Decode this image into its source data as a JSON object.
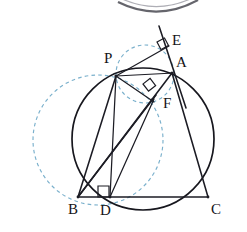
{
  "figure": {
    "canvas": {
      "width": 247,
      "height": 232,
      "background": "#ffffff"
    },
    "colors": {
      "stroke": "#1c1c24",
      "circle_stroke": "#17171e",
      "dashed_circle": "#7ab0cc",
      "label_text": "#141418",
      "top_arc": "#4a4a52"
    },
    "points": [
      {
        "id": "P",
        "label": "P",
        "x": 116,
        "y": 76,
        "label_x": 104,
        "label_y": 51
      },
      {
        "id": "A",
        "label": "A",
        "x": 172,
        "y": 73,
        "label_x": 176,
        "label_y": 55
      },
      {
        "id": "E",
        "label": "E",
        "x": 167,
        "y": 48,
        "label_x": 172,
        "label_y": 33
      },
      {
        "id": "F",
        "label": "F",
        "x": 152,
        "y": 100,
        "label_x": 163,
        "label_y": 96
      },
      {
        "id": "B",
        "label": "B",
        "x": 78,
        "y": 197,
        "label_x": 68,
        "label_y": 202
      },
      {
        "id": "D",
        "label": "D",
        "x": 110,
        "y": 197,
        "label_x": 100,
        "label_y": 203
      },
      {
        "id": "C",
        "label": "C",
        "x": 208,
        "y": 197,
        "label_x": 211,
        "label_y": 202
      }
    ],
    "segments": [
      {
        "name": "BC",
        "from": "B",
        "to": "C"
      },
      {
        "name": "AB",
        "from": "A",
        "to": "B"
      },
      {
        "name": "AC",
        "from": "A",
        "to": "C"
      },
      {
        "name": "PB",
        "from": "P",
        "to": "B"
      },
      {
        "name": "PD",
        "from": "P",
        "to": "D"
      },
      {
        "name": "PA",
        "from": "P",
        "to": "A"
      },
      {
        "name": "PE",
        "from": "P",
        "to": "E"
      },
      {
        "name": "PF",
        "from": "P",
        "to": "F"
      },
      {
        "name": "BF",
        "from": "B",
        "to": "F"
      },
      {
        "name": "DF",
        "from": "D",
        "to": "F"
      },
      {
        "name": "AF-ext",
        "from": "A",
        "to": "F"
      },
      {
        "name": "EA-ext",
        "from": "E",
        "to": "A"
      }
    ],
    "circles": [
      {
        "name": "circumcircle-ABC",
        "style": "solid",
        "cx": 143,
        "cy": 139,
        "r": 71
      },
      {
        "name": "dashed-circle-PBD",
        "style": "dashed",
        "cx": 98,
        "cy": 140,
        "r": 65
      },
      {
        "name": "dashed-circle-PEAF",
        "style": "dashed",
        "cx": 145,
        "cy": 74,
        "r": 29
      }
    ],
    "right_angle_marks": [
      {
        "name": "right-angle-at-E",
        "x": 157,
        "y": 42,
        "size": 9,
        "rotation": -28
      },
      {
        "name": "right-angle-at-F",
        "x": 143,
        "y": 84,
        "size": 9,
        "rotation": -38
      },
      {
        "name": "right-angle-at-D",
        "x": 99,
        "y": 185,
        "size": 10,
        "rotation": 0
      }
    ],
    "top_partial_arc": {
      "name": "cropped-arc-above",
      "present": true
    }
  }
}
